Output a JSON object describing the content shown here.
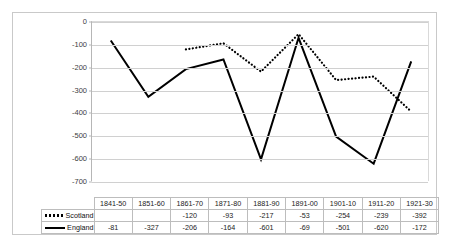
{
  "chart_data": {
    "type": "line",
    "title": "",
    "xlabel": "",
    "ylabel": "",
    "categories": [
      "1841-50",
      "1851-60",
      "1861-70",
      "1871-80",
      "1881-90",
      "1891-00",
      "1901-10",
      "1911-20",
      "1921-30"
    ],
    "ylim": [
      -700,
      0
    ],
    "ytick_labels": [
      "0",
      "-100",
      "-200",
      "-300",
      "-400",
      "-500",
      "-600",
      "-700"
    ],
    "ytick_values": [
      0,
      -100,
      -200,
      -300,
      -400,
      -500,
      -600,
      -700
    ],
    "grid": true,
    "legend_position": "data-table-left",
    "show_data_table": true,
    "series": [
      {
        "name": "Scotland",
        "style": "dotted",
        "color": "#000000",
        "values": [
          null,
          null,
          -120,
          -93,
          -217,
          -53,
          -254,
          -239,
          -392
        ],
        "display_values": [
          "",
          "",
          "-120",
          "-93",
          "-217",
          "-53",
          "-254",
          "-239",
          "-392"
        ]
      },
      {
        "name": "England",
        "style": "solid",
        "color": "#000000",
        "values": [
          -81,
          -327,
          -206,
          -164,
          -601,
          -69,
          -501,
          -620,
          -172
        ],
        "display_values": [
          "-81",
          "-327",
          "-206",
          "-164",
          "-601",
          "-69",
          "-501",
          "-620",
          "-172"
        ]
      }
    ]
  },
  "colors": {
    "series": "#000000",
    "gridline": "#d0d0d0",
    "frame": "#c9c9c9",
    "table_border": "#bdbdbd",
    "background": "#ffffff"
  }
}
